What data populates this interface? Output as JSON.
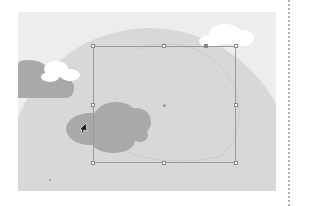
{
  "app": {
    "view": "artboard-canvas",
    "tool": "direct-selection"
  },
  "canvas": {
    "background": "#ededed",
    "x": 18,
    "y": 12,
    "width": 258,
    "height": 179
  },
  "artwork": {
    "sun": {
      "color": "#d8d8d8",
      "cx": 132,
      "cy": 158,
      "r": 142
    },
    "sun_outline_path_color": "#c8c8c8",
    "dark_clouds": [
      {
        "name": "left-dark-cloud",
        "color": "#a9a9a9"
      },
      {
        "name": "center-dark-cloud",
        "color": "#a9a9a9"
      }
    ],
    "white_clouds": [
      {
        "name": "top-right-white-cloud",
        "color": "#ffffff"
      },
      {
        "name": "left-white-cloud",
        "color": "#ffffff"
      }
    ]
  },
  "selection": {
    "bbox": {
      "x": 93,
      "y": 46,
      "width": 143,
      "height": 117
    },
    "stroke": "#9a9a9a",
    "handles": 8,
    "center": {
      "x": 164,
      "y": 105
    }
  },
  "guide": {
    "type": "dotted",
    "x": 288
  }
}
